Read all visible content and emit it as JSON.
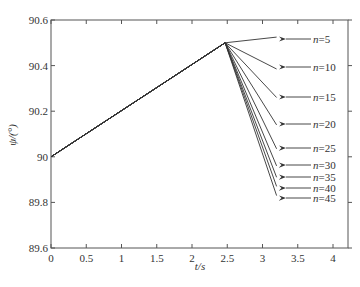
{
  "chart_data": {
    "type": "line",
    "title": "",
    "xlabel": "t/s",
    "ylabel": "ψ/(°)",
    "xlim": [
      0,
      4.2
    ],
    "ylim": [
      89.6,
      90.6
    ],
    "xticks": [
      "0",
      "0.5",
      "1",
      "1.5",
      "2",
      "2.5",
      "3",
      "3.5",
      "4"
    ],
    "yticks": [
      "89.6",
      "89.8",
      "90",
      "90.2",
      "90.4",
      "90.6"
    ],
    "grid": false,
    "legend_position": "right-annotations",
    "common_segment": {
      "x": [
        0,
        2.47
      ],
      "y": [
        90.0,
        90.5
      ]
    },
    "series": [
      {
        "name": "n=5",
        "x": [
          0,
          2.47,
          3.2
        ],
        "y": [
          90.0,
          90.5,
          90.525
        ]
      },
      {
        "name": "n=10",
        "x": [
          0,
          2.47,
          3.2
        ],
        "y": [
          90.0,
          90.5,
          90.385
        ]
      },
      {
        "name": "n=15",
        "x": [
          0,
          2.47,
          3.2
        ],
        "y": [
          90.0,
          90.5,
          90.26
        ]
      },
      {
        "name": "n=20",
        "x": [
          0,
          2.47,
          3.2
        ],
        "y": [
          90.0,
          90.5,
          90.14
        ]
      },
      {
        "name": "n=25",
        "x": [
          0,
          2.47,
          3.2
        ],
        "y": [
          90.0,
          90.5,
          90.035
        ]
      },
      {
        "name": "n=30",
        "x": [
          0,
          2.47,
          3.2
        ],
        "y": [
          90.0,
          90.5,
          89.96
        ]
      },
      {
        "name": "n=35",
        "x": [
          0,
          2.47,
          3.2
        ],
        "y": [
          90.0,
          90.5,
          89.91
        ]
      },
      {
        "name": "n=40",
        "x": [
          0,
          2.47,
          3.2
        ],
        "y": [
          90.0,
          90.5,
          89.87
        ]
      },
      {
        "name": "n=45",
        "x": [
          0,
          2.47,
          3.2
        ],
        "y": [
          90.0,
          90.5,
          89.83
        ]
      }
    ],
    "annotations": [
      {
        "text": "n=5",
        "label_y_px": 39
      },
      {
        "text": "n=10",
        "label_y_px": 67
      },
      {
        "text": "n=15",
        "label_y_px": 97
      },
      {
        "text": "n=20",
        "label_y_px": 124
      },
      {
        "text": "n=25",
        "label_y_px": 148
      },
      {
        "text": "n=30",
        "label_y_px": 165
      },
      {
        "text": "n=35",
        "label_y_px": 177
      },
      {
        "text": "n=40",
        "label_y_px": 188
      },
      {
        "text": "n=45",
        "label_y_px": 198
      }
    ]
  },
  "colors": {
    "line": "#333333",
    "axis": "#555555",
    "background": "#ffffff"
  },
  "caption": ""
}
